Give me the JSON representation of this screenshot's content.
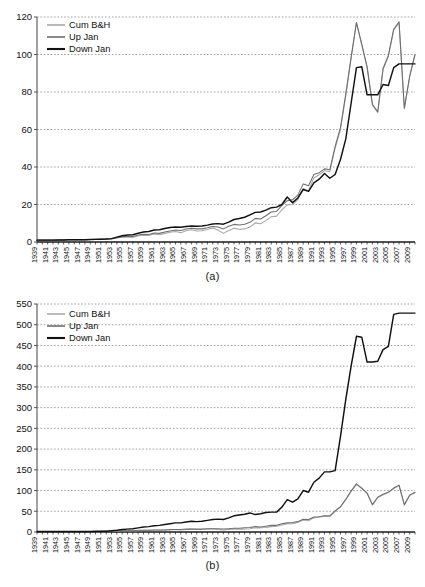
{
  "figure": {
    "panels": [
      {
        "id": "a",
        "caption": "(a)"
      },
      {
        "id": "b",
        "caption": "(b)"
      }
    ]
  },
  "legend": {
    "entries": [
      {
        "label": "Cum B&H",
        "color": "#a8a8a8",
        "width": 1.6
      },
      {
        "label": "Up Jan",
        "color": "#6e6e6e",
        "width": 1.6
      },
      {
        "label": "Down Jan",
        "color": "#111111",
        "width": 2.0
      }
    ],
    "position": "top-left"
  },
  "colors": {
    "axis": "#555555",
    "grid": "#8a8a8a",
    "text": "#111111",
    "background": "#ffffff",
    "cum_bh": "#a8a8a8",
    "up_jan": "#6e6e6e",
    "down_jan": "#111111"
  },
  "chart_data": [
    {
      "type": "line",
      "panel": "a",
      "title": "",
      "subtitle": "",
      "xlabel": "",
      "ylabel": "",
      "caption": "(a)",
      "grid": true,
      "legend_position": "top-left",
      "ylim": [
        0,
        120
      ],
      "yticks": [
        0,
        20,
        40,
        60,
        80,
        100,
        120
      ],
      "xlim": [
        1939,
        2010
      ],
      "xticks": [
        1939,
        1941,
        1943,
        1945,
        1947,
        1949,
        1951,
        1953,
        1955,
        1957,
        1959,
        1961,
        1963,
        1965,
        1967,
        1969,
        1971,
        1973,
        1975,
        1977,
        1979,
        1981,
        1983,
        1985,
        1987,
        1989,
        1991,
        1993,
        1995,
        1997,
        1999,
        2001,
        2003,
        2005,
        2007,
        2009
      ],
      "x": [
        1939,
        1940,
        1941,
        1942,
        1943,
        1944,
        1945,
        1946,
        1947,
        1948,
        1949,
        1950,
        1951,
        1952,
        1953,
        1954,
        1955,
        1956,
        1957,
        1958,
        1959,
        1960,
        1961,
        1962,
        1963,
        1964,
        1965,
        1966,
        1967,
        1968,
        1969,
        1970,
        1971,
        1972,
        1973,
        1974,
        1975,
        1976,
        1977,
        1978,
        1979,
        1980,
        1981,
        1982,
        1983,
        1984,
        1985,
        1986,
        1987,
        1988,
        1989,
        1990,
        1991,
        1992,
        1993,
        1994,
        1995,
        1996,
        1997,
        1998,
        1999,
        2000,
        2001,
        2002,
        2003,
        2004,
        2005,
        2006,
        2007,
        2008,
        2009,
        2010
      ],
      "series": [
        {
          "name": "Cum B&H",
          "color": "#a8a8a8",
          "values": [
            1.0,
            1.0,
            1.0,
            1.0,
            1.1,
            1.1,
            1.2,
            1.2,
            1.2,
            1.2,
            1.3,
            1.4,
            1.5,
            1.6,
            1.6,
            2.2,
            2.6,
            2.7,
            2.4,
            3.3,
            3.6,
            3.5,
            4.3,
            3.9,
            4.6,
            5.2,
            5.6,
            5.0,
            6.0,
            6.5,
            5.9,
            6.0,
            6.7,
            7.5,
            6.4,
            4.6,
            6.1,
            7.3,
            6.8,
            7.0,
            8.0,
            10.2,
            9.7,
            11.4,
            13.5,
            13.8,
            17.2,
            19.8,
            20.0,
            22.6,
            28.6,
            27.4,
            34.1,
            35.9,
            38.0,
            37.5,
            50.0,
            60.0,
            78.0,
            98.0,
            117.0,
            105.0,
            93.0,
            73.0,
            69.0,
            92.0,
            99.0,
            113.0,
            117.0,
            71.0,
            88.0,
            100.0
          ]
        },
        {
          "name": "Up Jan",
          "color": "#6e6e6e",
          "values": [
            1.0,
            1.0,
            1.0,
            1.0,
            1.1,
            1.1,
            1.2,
            1.2,
            1.2,
            1.2,
            1.3,
            1.4,
            1.5,
            1.6,
            1.7,
            2.3,
            2.8,
            3.0,
            2.9,
            3.7,
            4.1,
            4.0,
            4.8,
            4.6,
            5.3,
            5.9,
            6.4,
            6.1,
            6.9,
            7.3,
            7.0,
            7.0,
            7.6,
            8.3,
            8.0,
            7.0,
            8.4,
            9.4,
            9.1,
            9.5,
            10.5,
            12.6,
            12.3,
            14.0,
            16.0,
            16.3,
            19.5,
            22.0,
            22.5,
            25.0,
            31.0,
            30.0,
            36.0,
            37.0,
            39.0,
            38.5,
            51.0,
            61.0,
            79.0,
            98.5,
            117.0,
            105.5,
            93.5,
            73.5,
            69.5,
            92.5,
            99.5,
            113.5,
            117.5,
            71.5,
            88.5,
            100.0
          ]
        },
        {
          "name": "Down Jan",
          "color": "#111111",
          "values": [
            1.0,
            1.0,
            1.0,
            1.0,
            1.1,
            1.1,
            1.2,
            1.2,
            1.2,
            1.2,
            1.3,
            1.4,
            1.5,
            1.6,
            1.8,
            2.6,
            3.3,
            3.7,
            3.9,
            4.7,
            5.3,
            5.6,
            6.4,
            6.5,
            7.2,
            7.7,
            8.0,
            7.9,
            8.3,
            8.5,
            8.4,
            8.5,
            9.0,
            9.6,
            9.8,
            9.5,
            10.6,
            12.0,
            12.5,
            13.2,
            14.5,
            15.8,
            16.0,
            17.0,
            18.3,
            18.6,
            20.0,
            24.0,
            21.0,
            23.5,
            28.0,
            27.0,
            31.5,
            33.5,
            36.5,
            34.0,
            36.0,
            44.0,
            55.0,
            74.0,
            93.0,
            93.5,
            78.5,
            78.5,
            78.5,
            84.0,
            83.5,
            93.0,
            95.0,
            95.0,
            95.0,
            95.0
          ]
        }
      ]
    },
    {
      "type": "line",
      "panel": "b",
      "title": "",
      "subtitle": "",
      "xlabel": "",
      "ylabel": "",
      "caption": "(b)",
      "grid": true,
      "legend_position": "top-left",
      "ylim": [
        0,
        550
      ],
      "yticks": [
        0,
        50,
        100,
        150,
        200,
        250,
        300,
        350,
        400,
        450,
        500,
        550
      ],
      "xlim": [
        1939,
        2010
      ],
      "xticks": [
        1939,
        1941,
        1943,
        1945,
        1947,
        1949,
        1951,
        1953,
        1955,
        1957,
        1959,
        1961,
        1963,
        1965,
        1967,
        1969,
        1971,
        1973,
        1975,
        1977,
        1979,
        1981,
        1983,
        1985,
        1987,
        1989,
        1991,
        1993,
        1995,
        1997,
        1999,
        2001,
        2003,
        2005,
        2007,
        2009
      ],
      "x": [
        1939,
        1940,
        1941,
        1942,
        1943,
        1944,
        1945,
        1946,
        1947,
        1948,
        1949,
        1950,
        1951,
        1952,
        1953,
        1954,
        1955,
        1956,
        1957,
        1958,
        1959,
        1960,
        1961,
        1962,
        1963,
        1964,
        1965,
        1966,
        1967,
        1968,
        1969,
        1970,
        1971,
        1972,
        1973,
        1974,
        1975,
        1976,
        1977,
        1978,
        1979,
        1980,
        1981,
        1982,
        1983,
        1984,
        1985,
        1986,
        1987,
        1988,
        1989,
        1990,
        1991,
        1992,
        1993,
        1994,
        1995,
        1996,
        1997,
        1998,
        1999,
        2000,
        2001,
        2002,
        2003,
        2004,
        2005,
        2006,
        2007,
        2008,
        2009,
        2010
      ],
      "series": [
        {
          "name": "Cum B&H",
          "color": "#a8a8a8",
          "values": [
            1,
            1,
            1,
            1,
            1,
            1,
            1,
            1,
            1,
            1,
            1,
            1,
            1,
            2,
            2,
            2,
            3,
            3,
            3,
            3,
            4,
            4,
            4,
            4,
            5,
            5,
            6,
            5,
            6,
            7,
            6,
            6,
            7,
            8,
            6,
            5,
            6,
            7,
            7,
            7,
            8,
            10,
            10,
            11,
            13,
            14,
            17,
            20,
            20,
            23,
            29,
            27,
            34,
            36,
            38,
            37,
            50,
            60,
            78,
            98,
            115,
            105,
            93,
            65,
            83,
            90,
            95,
            105,
            112,
            65,
            88,
            95
          ]
        },
        {
          "name": "Up Jan",
          "color": "#6e6e6e",
          "values": [
            1,
            1,
            1,
            1,
            1,
            1,
            1,
            1,
            1,
            1,
            1,
            1,
            2,
            2,
            2,
            2,
            3,
            3,
            3,
            4,
            4,
            4,
            5,
            5,
            5,
            6,
            6,
            6,
            7,
            7,
            7,
            7,
            8,
            8,
            8,
            7,
            8,
            9,
            9,
            10,
            11,
            13,
            12,
            14,
            16,
            16,
            20,
            22,
            23,
            25,
            31,
            30,
            36,
            37,
            39,
            39,
            51,
            61,
            79,
            99,
            116,
            106,
            94,
            66,
            84,
            91,
            96,
            106,
            113,
            66,
            89,
            96
          ]
        },
        {
          "name": "Down Jan",
          "color": "#111111",
          "values": [
            1,
            1,
            1,
            1,
            1,
            1,
            1,
            1,
            1,
            1,
            1,
            2,
            2,
            2,
            3,
            4,
            6,
            7,
            8,
            10,
            12,
            13,
            15,
            16,
            18,
            20,
            22,
            22,
            24,
            26,
            25,
            26,
            28,
            30,
            31,
            30,
            34,
            39,
            41,
            43,
            46,
            42,
            44,
            47,
            48,
            48,
            60,
            78,
            72,
            80,
            100,
            96,
            120,
            130,
            145,
            145,
            148,
            230,
            320,
            400,
            472,
            470,
            410,
            410,
            412,
            440,
            448,
            525,
            528,
            528,
            528,
            528
          ]
        }
      ]
    }
  ]
}
